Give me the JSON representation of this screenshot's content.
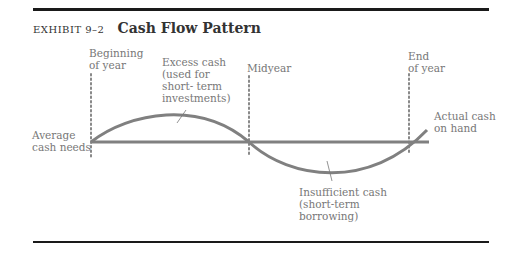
{
  "exhibit": {
    "number": "EXHIBIT 9–2",
    "title": "Cash Flow Pattern"
  },
  "labels": {
    "beginning": "Beginning\nof year",
    "midyear": "Midyear",
    "end": "End\nof year",
    "excess": "Excess cash\n(used for\nshort- term\ninvestments)",
    "average": "Average\ncash needs",
    "actual": "Actual cash\non hand",
    "insufficient": "Insufficient cash\n(short-term\nborrowing)"
  },
  "colors": {
    "curve": "#808080",
    "text": "#777777",
    "rule": "#1a1a1a"
  }
}
